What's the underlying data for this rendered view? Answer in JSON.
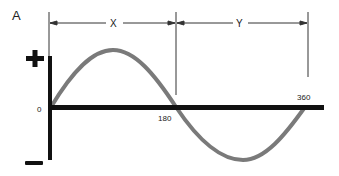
{
  "figure": {
    "panel_label": "A",
    "dimension_labels": {
      "first_half": "X",
      "second_half": "Y"
    },
    "axis": {
      "positive_sign": "+",
      "negative_sign": "–",
      "origin_label": "0",
      "tick_180": "180",
      "tick_360": "360"
    },
    "curve": {
      "type": "sine wave",
      "color": "#7a7a7a",
      "period_degrees": 360
    },
    "colors": {
      "axis": "#111111",
      "curve": "#7a7a7a",
      "dimension_lines": "#333333"
    }
  }
}
